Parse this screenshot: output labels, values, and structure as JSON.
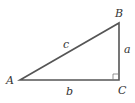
{
  "diagram": {
    "type": "right-triangle",
    "vertices": [
      {
        "id": "A",
        "label": "A",
        "x": 20,
        "y": 80
      },
      {
        "id": "B",
        "label": "B",
        "x": 119,
        "y": 23
      },
      {
        "id": "C",
        "label": "C",
        "x": 119,
        "y": 80
      }
    ],
    "sides": [
      {
        "id": "a",
        "label": "a",
        "from": "B",
        "to": "C"
      },
      {
        "id": "b",
        "label": "b",
        "from": "A",
        "to": "C"
      },
      {
        "id": "c",
        "label": "c",
        "from": "A",
        "to": "B"
      }
    ],
    "right_angle_at": "C",
    "stroke_color": "#555555",
    "label_color": "#333333"
  }
}
